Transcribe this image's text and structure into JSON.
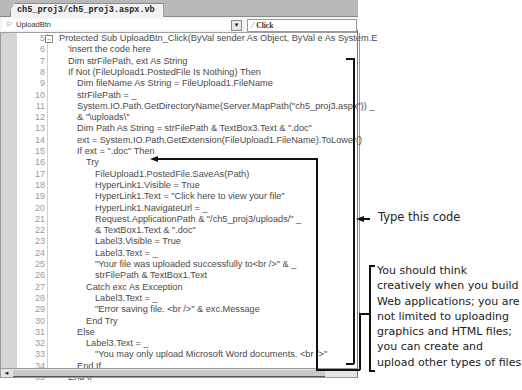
{
  "window": {
    "tab_title": "ch5_proj3/ch5_proj3.aspx.vb",
    "object_combo": "UploadBtn",
    "object_combo_icon": "control-icon",
    "event_combo": "Click",
    "event_combo_icon": "lightning-icon"
  },
  "code_lines": [
    {
      "num": "5",
      "indent": 0,
      "text": "Protected Sub UploadBtn_Click(ByVal sender As Object, ByVal e As System.E"
    },
    {
      "num": "6",
      "indent": 1,
      "text": "'insert the code here"
    },
    {
      "num": "7",
      "indent": 1,
      "text": "Dim strFilePath, ext As String"
    },
    {
      "num": "8",
      "indent": 1,
      "text": "If Not (FileUpload1.PostedFile Is Nothing) Then"
    },
    {
      "num": "9",
      "indent": 2,
      "text": "Dim fileName As String = FileUpload1.FileName"
    },
    {
      "num": "10",
      "indent": 2,
      "text": "strFilePath = _"
    },
    {
      "num": "11",
      "indent": 2,
      "text": "System.IO.Path.GetDirectoryName(Server.MapPath(\"ch5_proj3.aspx\")) _"
    },
    {
      "num": "12",
      "indent": 2,
      "text": "& \"\\uploads\\\""
    },
    {
      "num": "13",
      "indent": 2,
      "text": "Dim Path As String = strFilePath & TextBox3.Text & \".doc\""
    },
    {
      "num": "14",
      "indent": 2,
      "text": "ext = System.IO.Path.GetExtension(FileUpload1.FileName).ToLower()"
    },
    {
      "num": "15",
      "indent": 2,
      "text": "If ext = \".doc\" Then"
    },
    {
      "num": "16",
      "indent": 3,
      "text": "Try"
    },
    {
      "num": "17",
      "indent": 4,
      "text": "FileUpload1.PostedFile.SaveAs(Path)"
    },
    {
      "num": "18",
      "indent": 4,
      "text": "HyperLink1.Visible = True"
    },
    {
      "num": "19",
      "indent": 4,
      "text": "HyperLink1.Text = \"Click here to view your file\""
    },
    {
      "num": "20",
      "indent": 4,
      "text": "HyperLink1.NavigateUrl = _"
    },
    {
      "num": "21",
      "indent": 4,
      "text": "Request.ApplicationPath & \"/ch5_proj3/uploads/\" _"
    },
    {
      "num": "22",
      "indent": 4,
      "text": "& TextBox1.Text & \".doc\""
    },
    {
      "num": "23",
      "indent": 4,
      "text": "Label3.Visible = True"
    },
    {
      "num": "24",
      "indent": 4,
      "text": "Label3.Text = _"
    },
    {
      "num": "25",
      "indent": 4,
      "text": "\"Your file was uploaded successfully to<br />\" & _"
    },
    {
      "num": "26",
      "indent": 4,
      "text": "strFilePath & TextBox1.Text"
    },
    {
      "num": "27",
      "indent": 3,
      "text": "Catch exc As Exception"
    },
    {
      "num": "28",
      "indent": 4,
      "text": "Label3.Text = _"
    },
    {
      "num": "29",
      "indent": 4,
      "text": "\"Error saving file. <br />\" & exc.Message"
    },
    {
      "num": "30",
      "indent": 3,
      "text": "End Try"
    },
    {
      "num": "31",
      "indent": 2,
      "text": "Else"
    },
    {
      "num": "32",
      "indent": 3,
      "text": "Label3.Text = _"
    },
    {
      "num": "33",
      "indent": 4,
      "text": "\"You may only upload Microsoft Word documents. <br />\""
    },
    {
      "num": "34",
      "indent": 2,
      "text": "End If"
    },
    {
      "num": "35",
      "indent": 1,
      "text": "End If"
    }
  ],
  "annotations": {
    "type_code": "Type this code",
    "creative_note": "You should think creatively when you build Web applications; you are not limited to uploading graphics and HTML files; you can create and upload other types of files"
  }
}
